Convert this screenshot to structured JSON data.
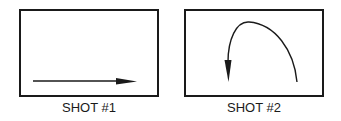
{
  "figure": {
    "panels": [
      {
        "label": "SHOT #1",
        "motion": "straight arrow left to right"
      },
      {
        "label": "SHOT #2",
        "motion": "curved arc arrow, rising from right and descending on left"
      }
    ],
    "colors": {
      "stroke": "#1a1a1a",
      "background": "#ffffff"
    }
  }
}
